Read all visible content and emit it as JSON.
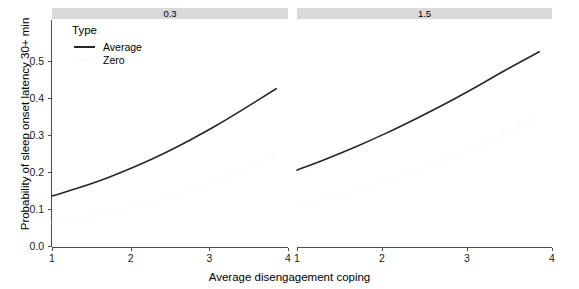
{
  "chart_data": {
    "type": "line",
    "title": "",
    "subtitle": "",
    "xlabel": "Average disengagement coping",
    "ylabel": "Probability of sleep onset latency 30+ min",
    "xlim": [
      1,
      4
    ],
    "ylim": [
      0.0,
      0.55
    ],
    "grid": false,
    "legend_position": "top-left-inside",
    "legend_title": "Type",
    "facet_variable": "",
    "facets": [
      {
        "strip_label": "0.3",
        "xticks": [
          "1",
          "2",
          "3",
          "4"
        ],
        "xtick_values": [
          1,
          2,
          3,
          4
        ],
        "series": [
          {
            "name": "Average",
            "color": "#262626",
            "x": [
              1.0,
              1.35,
              1.7,
              2.05,
              2.4,
              2.75,
              3.1,
              3.45,
              3.85
            ],
            "values": [
              0.135,
              0.158,
              0.184,
              0.214,
              0.248,
              0.286,
              0.327,
              0.372,
              0.425
            ]
          },
          {
            "name": "Zero",
            "color": "#fafafa",
            "x": [
              1.0,
              1.35,
              1.7,
              2.05,
              2.4,
              2.75,
              3.1,
              3.45,
              3.85
            ],
            "values": [
              0.063,
              0.075,
              0.089,
              0.106,
              0.126,
              0.149,
              0.176,
              0.206,
              0.245
            ]
          }
        ]
      },
      {
        "strip_label": "1.5",
        "xticks": [
          "1",
          "2",
          "3",
          "4"
        ],
        "xtick_values": [
          1,
          2,
          3,
          4
        ],
        "series": [
          {
            "name": "Average",
            "color": "#262626",
            "x": [
              1.0,
              1.35,
              1.7,
              2.05,
              2.4,
              2.75,
              3.1,
              3.45,
              3.85
            ],
            "values": [
              0.205,
              0.236,
              0.269,
              0.305,
              0.344,
              0.385,
              0.429,
              0.475,
              0.525
            ]
          },
          {
            "name": "Zero",
            "color": "#fafafa",
            "x": [
              1.0,
              1.35,
              1.7,
              2.05,
              2.4,
              2.75,
              3.1,
              3.45,
              3.85
            ],
            "values": [
              0.11,
              0.129,
              0.151,
              0.175,
              0.202,
              0.233,
              0.267,
              0.305,
              0.35
            ]
          }
        ]
      }
    ],
    "yticks": [
      "0.0",
      "0.1",
      "0.2",
      "0.3",
      "0.4",
      "0.5"
    ],
    "ytick_values": [
      0.0,
      0.1,
      0.2,
      0.3,
      0.4,
      0.5
    ],
    "legend_entries": [
      {
        "label": "Average",
        "color": "#262626"
      },
      {
        "label": "Zero",
        "color": "#fafafa"
      }
    ],
    "colors": {
      "axis": "#4d4d4d",
      "strip_background": "#d9d9d9",
      "panel_background": "#ffffff",
      "text": "#000000"
    }
  }
}
